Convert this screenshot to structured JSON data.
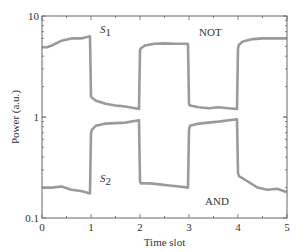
{
  "chart_data": {
    "type": "line",
    "title": "",
    "xlabel": "Time slot",
    "ylabel": "Power (a.u.)",
    "xlim": [
      0,
      5
    ],
    "ylim": [
      0.1,
      10
    ],
    "yscale": "log",
    "x_ticks": [
      "0",
      "1",
      "2",
      "3",
      "4",
      "5"
    ],
    "y_ticks": [
      "0.1",
      "1",
      "10"
    ],
    "grid": false,
    "legend": null,
    "series": [
      {
        "name": "S1",
        "color": "#9a9a9a",
        "x": [
          0,
          0.1,
          0.2,
          0.4,
          0.6,
          0.8,
          0.98,
          1.0,
          1.02,
          1.1,
          1.3,
          1.5,
          1.7,
          1.9,
          1.98,
          2.0,
          2.02,
          2.1,
          2.3,
          2.5,
          2.7,
          2.98,
          3.0,
          3.02,
          3.2,
          3.4,
          3.6,
          3.8,
          3.98,
          4.0,
          4.02,
          4.1,
          4.3,
          4.5,
          4.7,
          5.0
        ],
        "values": [
          4.9,
          4.9,
          5.1,
          5.7,
          6.0,
          6.0,
          6.3,
          1.6,
          1.55,
          1.45,
          1.35,
          1.3,
          1.27,
          1.22,
          1.2,
          4.6,
          4.8,
          5.1,
          5.3,
          5.35,
          5.3,
          5.3,
          1.35,
          1.3,
          1.25,
          1.22,
          1.25,
          1.22,
          1.2,
          4.8,
          5.2,
          5.6,
          5.9,
          6.0,
          6.0,
          6.0
        ]
      },
      {
        "name": "S2",
        "color": "#9a9a9a",
        "x": [
          0,
          0.2,
          0.4,
          0.6,
          0.8,
          0.98,
          1.0,
          1.02,
          1.1,
          1.3,
          1.5,
          1.7,
          1.98,
          2.0,
          2.02,
          2.2,
          2.4,
          2.6,
          2.8,
          2.98,
          3.0,
          3.02,
          3.2,
          3.4,
          3.6,
          3.98,
          4.0,
          4.02,
          4.2,
          4.4,
          4.6,
          4.8,
          5.0
        ],
        "values": [
          0.2,
          0.2,
          0.205,
          0.19,
          0.185,
          0.175,
          0.7,
          0.75,
          0.82,
          0.86,
          0.87,
          0.88,
          0.93,
          0.23,
          0.22,
          0.22,
          0.215,
          0.21,
          0.205,
          0.2,
          0.75,
          0.82,
          0.86,
          0.88,
          0.9,
          0.95,
          0.28,
          0.26,
          0.23,
          0.2,
          0.19,
          0.195,
          0.18
        ]
      }
    ],
    "annotations": [
      {
        "text": "S",
        "sub": "1",
        "x": 1.2,
        "y": 7.6
      },
      {
        "text": "NOT",
        "x": 2.75,
        "y": 7.2
      },
      {
        "text": "S",
        "sub": "2",
        "x": 1.2,
        "y": 0.3
      },
      {
        "text": "AND",
        "x": 3.05,
        "y": 0.14
      }
    ]
  },
  "labels": {
    "xlabel": "Time slot",
    "ylabel": "Power (a.u.)",
    "s1": "S",
    "s1_sub": "1",
    "s2": "S",
    "s2_sub": "2",
    "not": "NOT",
    "and": "AND"
  }
}
